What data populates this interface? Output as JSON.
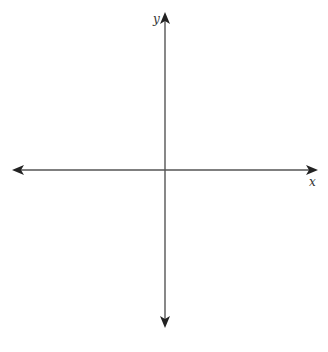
{
  "diagram": {
    "type": "coordinate-plane",
    "x_axis": {
      "label": "x",
      "direction": "bidirectional"
    },
    "y_axis": {
      "label": "y",
      "direction": "bidirectional"
    },
    "colors": {
      "axis": "#555555",
      "arrowhead": "#222222",
      "background": "#ffffff"
    }
  }
}
